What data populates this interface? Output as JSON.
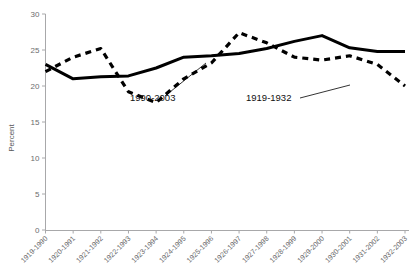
{
  "chart_data": {
    "type": "line",
    "title": "",
    "xlabel": "",
    "ylabel": "Percent",
    "ylim": [
      0,
      30
    ],
    "yticks": [
      0,
      5,
      10,
      15,
      20,
      25,
      30
    ],
    "ytick_labels": [
      "0",
      "5",
      "10",
      "15",
      "20",
      "25",
      "30"
    ],
    "grid": false,
    "legend_position": "inline-annotations",
    "categories": [
      "1919-1990",
      "1920-1991",
      "1921-1992",
      "1922-1993",
      "1923-1994",
      "1924-1995",
      "1925-1996",
      "1926-1997",
      "1927-1998",
      "1928-1999",
      "1929-2000",
      "1930-2001",
      "1931-2002",
      "1932-2003"
    ],
    "series": [
      {
        "name": "1990-2003",
        "style": "solid",
        "color": "#000000",
        "values": [
          23.0,
          21.0,
          21.3,
          21.4,
          22.5,
          24.0,
          24.2,
          24.5,
          25.2,
          26.2,
          27.0,
          25.3,
          24.8,
          24.8
        ]
      },
      {
        "name": "1919-1932",
        "style": "dashed",
        "color": "#000000",
        "values": [
          22.0,
          24.0,
          25.2,
          19.2,
          17.7,
          21.0,
          23.2,
          27.4,
          26.0,
          24.0,
          23.6,
          24.2,
          23.0,
          20.0
        ]
      }
    ],
    "annotations": [
      {
        "label": "1990-2003",
        "text_x": 130,
        "text_y": 101,
        "leader_from_x": 165,
        "leader_from_y": 96,
        "leader_to_x": 206,
        "leader_to_y": 63
      },
      {
        "label": "1919-1932",
        "text_x": 246,
        "text_y": 101,
        "leader_from_x": 300,
        "leader_from_y": 98,
        "leader_to_x": 350,
        "leader_to_y": 85
      }
    ]
  },
  "axis": {
    "y_title": "Percent"
  }
}
